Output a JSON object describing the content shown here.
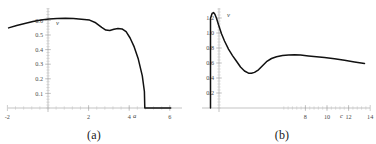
{
  "figure": {
    "panels": [
      {
        "caption": "(a)",
        "xlabel": "a",
        "ylabel": "v"
      },
      {
        "caption": "(b)",
        "xlabel": "c",
        "ylabel": "v"
      }
    ]
  },
  "chart_data": [
    {
      "type": "line",
      "panel": "(a)",
      "title": "",
      "xlabel": "a",
      "ylabel": "v",
      "xlim": [
        -2.4,
        6.2
      ],
      "ylim": [
        0,
        0.68
      ],
      "xticks": [
        -2,
        2,
        4,
        6
      ],
      "xtick_labels": [
        "-2",
        "2",
        "4",
        "6"
      ],
      "yticks": [
        0.1,
        0.2,
        0.3,
        0.4,
        0.5,
        0.6
      ],
      "ytick_labels": [
        "0.1",
        "0.2",
        "0.3",
        "0.4",
        "0.5",
        "0.6"
      ],
      "x_minor_step": 0.4,
      "y_minor_step": 0.02,
      "grid": false,
      "legend": null,
      "series": [
        {
          "name": "v(a)",
          "x": [
            -2.0,
            -1.6,
            -1.2,
            -0.8,
            -0.4,
            0.0,
            0.4,
            0.8,
            1.2,
            1.6,
            2.0,
            2.3,
            2.6,
            2.8,
            3.0,
            3.2,
            3.4,
            3.6,
            3.8,
            4.0,
            4.2,
            4.4,
            4.6,
            4.7,
            4.72,
            5.0,
            5.4,
            5.8,
            6.0
          ],
          "y": [
            0.578,
            0.594,
            0.608,
            0.62,
            0.63,
            0.637,
            0.641,
            0.642,
            0.64,
            0.636,
            0.63,
            0.612,
            0.581,
            0.563,
            0.56,
            0.568,
            0.574,
            0.571,
            0.552,
            0.51,
            0.45,
            0.368,
            0.255,
            0.15,
            0.0,
            0.0,
            0.0,
            0.0,
            0.0
          ]
        }
      ]
    },
    {
      "type": "line",
      "panel": "(b)",
      "title": "",
      "xlabel": "c",
      "ylabel": "v",
      "xlim": [
        5.9,
        14.4
      ],
      "ylim": [
        0,
        1.32
      ],
      "xticks": [
        8,
        10,
        12,
        14
      ],
      "xtick_labels": [
        "8",
        "10",
        "12",
        "14"
      ],
      "yticks": [
        0.2,
        0.4,
        0.6,
        0.8,
        1.0,
        1.2
      ],
      "ytick_labels": [
        "0.2",
        "0.4",
        "0.6",
        "0.8",
        "1.0",
        "1.2"
      ],
      "x_minor_step": 0.4,
      "y_minor_step": 0.04,
      "grid": false,
      "legend": null,
      "series": [
        {
          "name": "v(c)",
          "x": [
            6.3,
            6.3,
            6.38,
            6.45,
            6.52,
            6.6,
            6.7,
            6.85,
            7.0,
            7.2,
            7.4,
            7.6,
            7.8,
            8.0,
            8.2,
            8.35,
            8.5,
            8.7,
            8.9,
            9.1,
            9.35,
            9.6,
            9.9,
            10.2,
            10.5,
            10.8,
            11.2,
            11.6,
            12.0,
            12.5,
            13.0,
            13.5,
            14.0
          ],
          "y": [
            0.0,
            1.14,
            1.21,
            1.22,
            1.2,
            1.15,
            1.07,
            0.96,
            0.87,
            0.77,
            0.69,
            0.62,
            0.55,
            0.5,
            0.473,
            0.472,
            0.483,
            0.515,
            0.565,
            0.615,
            0.655,
            0.675,
            0.69,
            0.697,
            0.699,
            0.695,
            0.685,
            0.675,
            0.665,
            0.65,
            0.632,
            0.612,
            0.592
          ]
        }
      ]
    }
  ]
}
